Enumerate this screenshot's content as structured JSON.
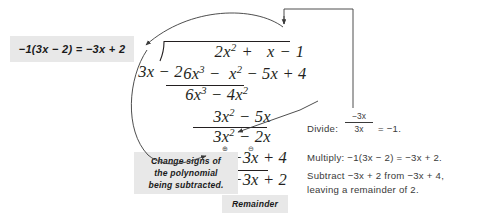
{
  "problem": {
    "divisor": "3x − 2",
    "dividend": "6x3 − x2 − 5x + 4",
    "quotient": "2x2 + x − 1",
    "remainder": "2"
  },
  "division": {
    "quotient_terms": "2x² +   x − 1",
    "divisor_text": "3x − 2",
    "dividend_text": "6x³ −  x² − 5x + 4",
    "row1": "6x³ − 4x²",
    "row2": "3x² − 5x",
    "row3": "3x² − 2x",
    "row4": "−3x + 4",
    "row5": "−3x + 2",
    "remainder_value": "2",
    "minus_sign": "−",
    "plus_circle": "⊕",
    "minus_circle": "⊖"
  },
  "callouts": {
    "sign_change_equation": "−1(3x − 2) = −3x + 2",
    "change_signs_line1": "Change signs of",
    "change_signs_line2": "the polynomial",
    "change_signs_line3": "being subtracted.",
    "remainder_label": "Remainder"
  },
  "steps": {
    "divide_label": "Divide:",
    "divide_numerator": "−3x",
    "divide_denominator": "3x",
    "divide_result": "= −1.",
    "multiply_line": "Multiply:  −1(3x − 2) = −3x + 2.",
    "subtract_line1": "Subtract −3x + 2 from −3x + 4,",
    "subtract_line2": "leaving a remainder of 2."
  },
  "colors": {
    "ink": "#231f20",
    "callout_bg": "#e8e8e8",
    "step_text": "#3a3a3a",
    "background": "#ffffff"
  }
}
